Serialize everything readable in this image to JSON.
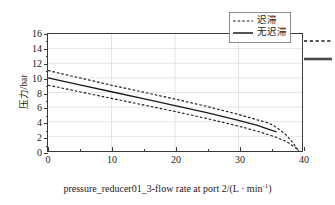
{
  "chart_data": {
    "type": "line",
    "title": "",
    "xlabel": "pressure_reducer01_3-flow rate at port 2/(L · min",
    "xlabel_sup": "-1",
    "xlabel_tail": ")",
    "ylabel": "压力/bar",
    "xlim": [
      0,
      40
    ],
    "ylim": [
      0,
      16
    ],
    "xticks": [
      0,
      10,
      20,
      30,
      40
    ],
    "xtick_labels": [
      "0",
      "10",
      "20",
      "30",
      "40"
    ],
    "xminor": [
      5,
      15,
      25,
      35
    ],
    "yticks": [
      0,
      2,
      4,
      6,
      8,
      10,
      12,
      14,
      16
    ],
    "ytick_labels": [
      "0",
      "2",
      "4",
      "6",
      "8",
      "10",
      "12",
      "14",
      "16"
    ],
    "yminor": [
      1,
      3,
      5,
      7,
      9,
      11,
      13,
      15
    ],
    "grid": true,
    "grid_color": "#d9d9d9",
    "legend_position": "top-right",
    "series": [
      {
        "name": "迟滞",
        "style": "dashed",
        "color": "#1a1a1a",
        "branch": "upper",
        "x": [
          0,
          5,
          10,
          15,
          20,
          25,
          30,
          33,
          34.5,
          35.5,
          36.5,
          37.5,
          38.5,
          39.5
        ],
        "y": [
          11.0,
          10.0,
          9.0,
          8.05,
          7.1,
          6.1,
          5.0,
          4.25,
          3.9,
          3.5,
          2.9,
          2.2,
          1.2,
          0.0
        ]
      },
      {
        "name": "无迟滞",
        "style": "solid",
        "color": "#1a1a1a",
        "branch": "middle",
        "x": [
          0,
          5,
          10,
          15,
          20,
          25,
          30,
          33,
          35,
          36
        ],
        "y": [
          10.0,
          9.05,
          8.1,
          7.15,
          6.2,
          5.25,
          4.2,
          3.5,
          2.9,
          2.6
        ]
      },
      {
        "name": "迟滞",
        "style": "dashed",
        "color": "#1a1a1a",
        "branch": "lower",
        "x": [
          0,
          5,
          10,
          15,
          20,
          25,
          30,
          33,
          35,
          36,
          37,
          38,
          39,
          39.5
        ],
        "y": [
          9.0,
          8.1,
          7.2,
          6.3,
          5.4,
          4.45,
          3.4,
          2.7,
          2.15,
          1.85,
          1.5,
          1.05,
          0.4,
          0.0
        ]
      }
    ]
  },
  "legend": {
    "items": [
      {
        "label": "迟滞",
        "style": "dashed"
      },
      {
        "label": "无迟滞",
        "style": "solid"
      }
    ]
  },
  "edge_samples": [
    {
      "name": "dashed-sample",
      "style": "dashed"
    },
    {
      "name": "solid-sample",
      "style": "solid"
    }
  ]
}
